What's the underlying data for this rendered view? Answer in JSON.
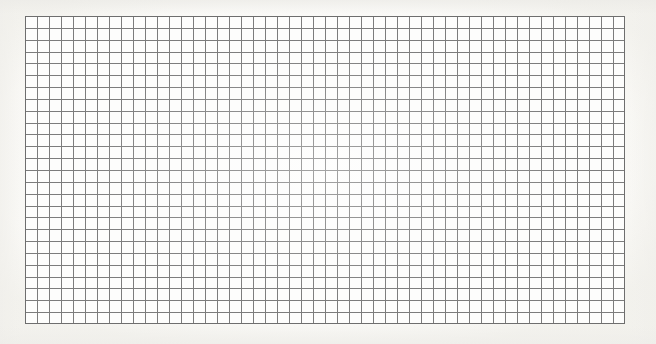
{
  "document": {
    "title": "Grid Paper Scan",
    "kind": "blank-graph-paper",
    "description": "A scanned sheet of blank square grid (graph) paper with no markings, text, or plotted data.",
    "background_color": "#fefefd",
    "paper_color": "#fdfdfc"
  },
  "grid": {
    "x": 25,
    "y": 16,
    "width": 600,
    "height": 308,
    "columns": 50,
    "rows": 26,
    "cell_width": 12,
    "cell_height": 11.85,
    "line_color": "#7c7c7c",
    "line_width": 1,
    "border_color": "#6e6e6e",
    "border_width": 1,
    "has_major_lines": false,
    "has_labels": false,
    "has_content": false
  },
  "chart_data": {
    "type": "table",
    "title": "",
    "subtitle": "",
    "xlabel": "",
    "ylabel": "",
    "categories": [],
    "values": [],
    "series": [],
    "annotations": [],
    "legend": [],
    "grid": true,
    "legend_position": "none",
    "note": "Empty grid sheet — no data series, axes, tick labels, or legend are present in the image."
  }
}
